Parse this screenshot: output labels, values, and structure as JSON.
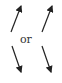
{
  "diagram": {
    "connector_text": "or",
    "arrows": [
      {
        "name": "top-left",
        "direction": "up-right"
      },
      {
        "name": "top-right",
        "direction": "up-right"
      },
      {
        "name": "bottom-left",
        "direction": "down-right"
      },
      {
        "name": "bottom-right",
        "direction": "down-right"
      }
    ],
    "color": "#222222"
  }
}
